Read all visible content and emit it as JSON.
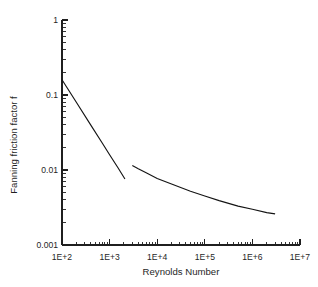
{
  "chart_data": {
    "type": "line",
    "title": "",
    "subtitle": "",
    "xlabel": "Reynolds Number",
    "ylabel": "Fanning friction factor f",
    "xscale": "log",
    "yscale": "log",
    "xlim": [
      100,
      10000000
    ],
    "ylim": [
      0.001,
      1
    ],
    "grid": false,
    "legend": false,
    "legend_position": "none",
    "xticklabels": [
      "1E+2",
      "1E+3",
      "1E+4",
      "1E+5",
      "1E+6",
      "1E+7"
    ],
    "xtickvalues": [
      100,
      1000,
      10000,
      100000,
      1000000,
      10000000
    ],
    "yticklabels": [
      "1",
      "0.1",
      "0.01",
      "0.001"
    ],
    "ytickvalues": [
      1,
      0.1,
      0.01,
      0.001
    ],
    "minor_ticks": true,
    "annotations": [],
    "series": [
      {
        "name": "laminar",
        "x": [
          100,
          200,
          400,
          700,
          1000,
          1500,
          2100
        ],
        "y": [
          0.16,
          0.08,
          0.04,
          0.0229,
          0.016,
          0.0107,
          0.0076
        ]
      },
      {
        "name": "turbulent",
        "x": [
          3000,
          4000,
          6000,
          10000,
          20000,
          50000,
          100000,
          200000,
          500000,
          1000000,
          2000000,
          3000000
        ],
        "y": [
          0.0115,
          0.0104,
          0.0091,
          0.0077,
          0.0065,
          0.0052,
          0.0045,
          0.0039,
          0.0033,
          0.003,
          0.0027,
          0.0026
        ]
      }
    ]
  },
  "geometry": {
    "plot_left": 62,
    "plot_right": 300,
    "plot_top": 20,
    "plot_bottom": 245
  }
}
